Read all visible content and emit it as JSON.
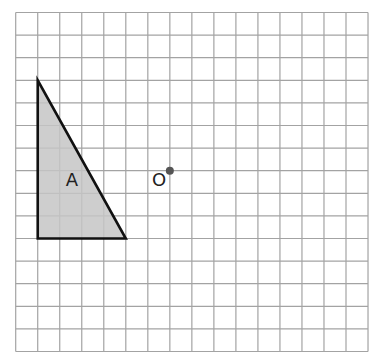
{
  "grid": {
    "origin_x": 15.7,
    "origin_y": 12.5,
    "cell_w": 22.02,
    "cell_h": 22.6,
    "cols": 16,
    "rows": 15,
    "line_color": "#a3a3a3",
    "background": "#ffffff"
  },
  "shapes": [
    {
      "id": "A",
      "label": "A",
      "type": "right-triangle",
      "vertices": [
        [
          1,
          3
        ],
        [
          1,
          10
        ],
        [
          5,
          10
        ]
      ],
      "fill": "#c6c6c6",
      "stroke": "#111111",
      "label_pos": [
        2.55,
        7.45
      ]
    }
  ],
  "points": [
    {
      "id": "O",
      "label": "O",
      "position": [
        7,
        7
      ],
      "color": "#555555",
      "label_pos": [
        6.6,
        7.45
      ]
    }
  ]
}
